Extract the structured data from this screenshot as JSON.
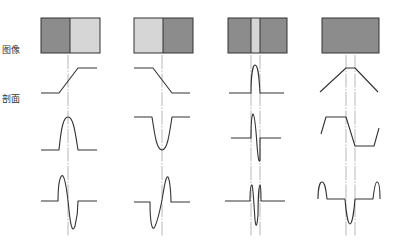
{
  "labels": {
    "image": "图像",
    "profile": "剖面"
  },
  "colors": {
    "dark": "#8c8c8c",
    "light": "#d6d6d6",
    "stroke": "#333333",
    "guide": "#888888"
  },
  "columns": [
    {
      "name": "step-edge-rising",
      "image_box": {
        "x": 41,
        "y": 18,
        "w": 59,
        "h": 35,
        "regions": [
          {
            "x": 41,
            "w": 29,
            "fill": "dark"
          },
          {
            "x": 70,
            "w": 30,
            "fill": "light"
          }
        ]
      },
      "guides": [
        68
      ],
      "profile": "M41,93 L59,93 L78,68 L97,68",
      "first_derivative": "M41,150 L59,150 C61,130 63,117 68,117 C73,117 75,130 78,150 L97,150",
      "second_derivative": "M41,201 L58,201 C58,180 61,174 63,176 C66,180 68,200 69,210 C71,230 73,232 75,226 C77,218 78,205 78,201 L97,201"
    },
    {
      "name": "step-edge-falling",
      "image_box": {
        "x": 134,
        "y": 18,
        "w": 59,
        "h": 35,
        "regions": [
          {
            "x": 134,
            "w": 29,
            "fill": "light"
          },
          {
            "x": 163,
            "w": 30,
            "fill": "dark"
          }
        ]
      },
      "guides": [
        162
      ],
      "profile": "M134,68 L153,68 L172,93 L190,93",
      "first_derivative": "M134,117 L152,117 C155,137 157,150 162,150 C167,150 169,137 172,117 L190,117",
      "second_derivative": "M134,202 L150,202 C150,222 152,230 154,228 C157,224 160,210 162,200 C164,188 166,175 168,177 C170,180 171,195 171,202 L190,202"
    },
    {
      "name": "thin-line",
      "image_box": {
        "x": 228,
        "y": 18,
        "w": 59,
        "h": 35,
        "regions": [
          {
            "x": 228,
            "w": 23,
            "fill": "dark"
          },
          {
            "x": 251,
            "w": 9,
            "fill": "light"
          },
          {
            "x": 260,
            "w": 27,
            "fill": "dark"
          }
        ]
      },
      "guides": [
        251,
        260
      ],
      "profile": "M229,93 L251,93 C251,75 253,65 255,65 C258,65 259,75 260,93 L284,93",
      "first_derivative": "M231,138 L251,138 C251,124 252,115 253,114 C255,115 256,130 257,145 C258,158 259,164 260,160 C260,150 260,140 260,138 L281,138",
      "second_derivative": "M225,201 L250,201 C250,190 251,185 252,185 C253,186 254,205 255,220 C256,228 257,227 258,215 C258,200 259,185 260,185 C261,186 261,195 261,201 L285,201"
    },
    {
      "name": "roof-edge",
      "image_box": {
        "x": 322,
        "y": 18,
        "w": 57,
        "h": 35,
        "regions": [
          {
            "x": 322,
            "w": 57,
            "fill": "dark"
          }
        ]
      },
      "guides": [
        346,
        355
      ],
      "profile": "M320,92 L346,68 L355,68 L378,92",
      "first_derivative": "M321,134 L326,117 L346,117 L355,146 L374,146 L379,128",
      "second_derivative": "M318,199 C318,188 320,182 322,182 C325,182 326,190 327,199 L345,199 C346,212 348,224 350,224 C352,224 354,212 355,199 L373,199 C374,190 375,182 377,182 C379,182 380,188 380,199"
    }
  ]
}
